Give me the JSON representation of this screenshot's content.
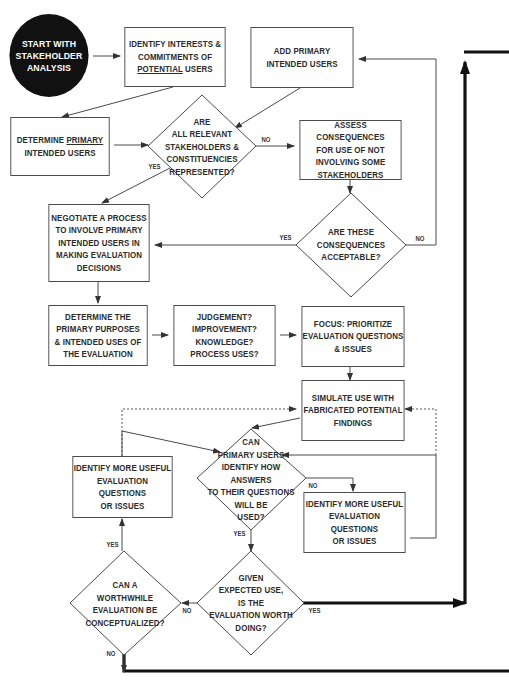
{
  "diagram": {
    "colors": {
      "line": "#4a4a4a",
      "text": "#2b2b2b",
      "start_fill": "#111111",
      "start_text": "#ffffff",
      "thick_line": "#111111"
    },
    "nodes": {
      "start": {
        "lines": [
          "START WITH",
          "STAKEHOLDER",
          "ANALYSIS"
        ]
      },
      "identify_interests": {
        "lines": [
          "IDENTIFY INTERESTS &",
          "COMMITMENTS OF",
          "POTENTIAL USERS"
        ],
        "underlined_word": "POTENTIAL"
      },
      "add_primary": {
        "lines": [
          "ADD PRIMARY",
          "INTENDED USERS"
        ]
      },
      "determine_primary": {
        "lines": [
          "DETERMINE PRIMARY",
          "INTENDED USERS"
        ],
        "underlined_word": "PRIMARY"
      },
      "all_relevant": {
        "lines": [
          "ARE",
          "ALL RELEVANT",
          "STAKEHOLDERS &",
          "CONSTITUENCIES",
          "REPRESENTED?"
        ]
      },
      "assess_consequences": {
        "lines": [
          "ASSESS CONSEQUENCES",
          "FOR USE OF NOT",
          "INVOLVING SOME",
          "STAKEHOLDERS"
        ]
      },
      "negotiate": {
        "lines": [
          "NEGOTIATE A PROCESS",
          "TO INVOLVE PRIMARY",
          "INTENDED USERS IN",
          "MAKING EVALUATION",
          "DECISIONS"
        ]
      },
      "acceptable": {
        "lines": [
          "ARE THESE",
          "CONSEQUENCES",
          "ACCEPTABLE?"
        ]
      },
      "purposes": {
        "lines": [
          "DETERMINE THE",
          "PRIMARY PURPOSES",
          "& INTENDED USES OF",
          "THE EVALUATION"
        ]
      },
      "uses": {
        "lines": [
          "JUDGEMENT?",
          "IMPROVEMENT?",
          "KNOWLEDGE?",
          "PROCESS USES?"
        ]
      },
      "focus": {
        "lines": [
          "FOCUS:  PRIORITIZE",
          "EVALUATION QUESTIONS",
          "& ISSUES"
        ]
      },
      "simulate": {
        "lines": [
          "SIMULATE USE WITH",
          "FABRICATED POTENTIAL",
          "FINDINGS"
        ]
      },
      "identify_more_left": {
        "lines": [
          "IDENTIFY MORE USEFUL",
          "EVALUATION QUESTIONS",
          "OR ISSUES"
        ]
      },
      "can_primary": {
        "lines": [
          "CAN",
          "PRIMARY USERS",
          "IDENTIFY HOW ANSWERS",
          "TO THEIR QUESTIONS",
          "WILL BE",
          "USED?"
        ]
      },
      "identify_more_right": {
        "lines": [
          "IDENTIFY MORE USEFUL",
          "EVALUATION QUESTIONS",
          "OR ISSUES"
        ]
      },
      "worthwhile": {
        "lines": [
          "CAN A",
          "WORTHWHILE",
          "EVALUATION BE",
          "CONCEPTUALIZED?"
        ]
      },
      "worth_doing": {
        "lines": [
          "GIVEN",
          "EXPECTED USE,",
          "IS THE",
          "EVALUATION WORTH",
          "DOING?"
        ]
      }
    },
    "edge_labels": {
      "represented_no": "NO",
      "represented_yes": "YES",
      "acceptable_yes": "YES",
      "acceptable_no": "NO",
      "can_primary_no": "NO",
      "can_primary_yes": "YES",
      "worthwhile_yes": "YES",
      "worthwhile_no": "NO",
      "worth_doing_no": "NO",
      "worth_doing_yes": "YES"
    }
  }
}
